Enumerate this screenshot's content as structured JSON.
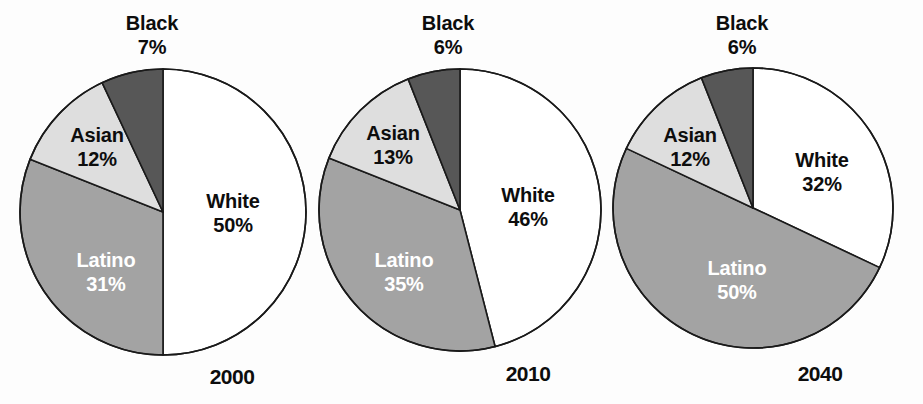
{
  "figure": {
    "width": 923,
    "height": 404,
    "background": "#fdfdfd"
  },
  "palette": {
    "White": "#ffffff",
    "Latino": "#a3a3a3",
    "Asian": "#dedede",
    "Black": "#575757",
    "outline": "#1a1a1a",
    "dark_text": "#0d0d0d",
    "light_text": "#ffffff"
  },
  "chart_data": [
    {
      "type": "pie",
      "title": "2000",
      "categories": [
        "White",
        "Latino",
        "Asian",
        "Black"
      ],
      "values": [
        50,
        31,
        12,
        7
      ],
      "labels": [
        "White\n50%",
        "Latino\n31%",
        "Asian\n12%",
        "Black\n7%"
      ],
      "colors": [
        "#ffffff",
        "#a3a3a3",
        "#dedede",
        "#575757"
      ],
      "start_angle_deg": 0,
      "direction": "clockwise",
      "center": [
        163,
        212
      ],
      "radius": 143,
      "legend": "none",
      "grid": false,
      "slices": [
        {
          "name": "White",
          "value": 50,
          "pct_label": "50%",
          "name_label": "White",
          "text_color": "#0d0d0d",
          "label_x": 233,
          "label_y": 213
        },
        {
          "name": "Latino",
          "value": 31,
          "pct_label": "31%",
          "name_label": "Latino",
          "text_color": "#ffffff",
          "label_x": 106,
          "label_y": 272
        },
        {
          "name": "Asian",
          "value": 12,
          "pct_label": "12%",
          "name_label": "Asian",
          "text_color": "#0d0d0d",
          "label_x": 97,
          "label_y": 147
        },
        {
          "name": "Black",
          "value": 7,
          "pct_label": "7%",
          "name_label": "Black",
          "text_color": "#0d0d0d",
          "label_x": 152,
          "label_y": 35
        }
      ],
      "year_label_x": 232,
      "year_label_y": 365
    },
    {
      "type": "pie",
      "title": "2010",
      "categories": [
        "White",
        "Latino",
        "Asian",
        "Black"
      ],
      "values": [
        46,
        35,
        13,
        6
      ],
      "labels": [
        "White\n46%",
        "Latino\n35%",
        "Asian\n13%",
        "Black\n6%"
      ],
      "colors": [
        "#ffffff",
        "#a3a3a3",
        "#dedede",
        "#575757"
      ],
      "start_angle_deg": 0,
      "direction": "clockwise",
      "center": [
        460,
        210
      ],
      "radius": 141,
      "legend": "none",
      "grid": false,
      "slices": [
        {
          "name": "White",
          "value": 46,
          "pct_label": "46%",
          "name_label": "White",
          "text_color": "#0d0d0d",
          "label_x": 528,
          "label_y": 207
        },
        {
          "name": "Latino",
          "value": 35,
          "pct_label": "35%",
          "name_label": "Latino",
          "text_color": "#ffffff",
          "label_x": 404,
          "label_y": 272
        },
        {
          "name": "Asian",
          "value": 13,
          "pct_label": "13%",
          "name_label": "Asian",
          "text_color": "#0d0d0d",
          "label_x": 393,
          "label_y": 145
        },
        {
          "name": "Black",
          "value": 6,
          "pct_label": "6%",
          "name_label": "Black",
          "text_color": "#0d0d0d",
          "label_x": 448,
          "label_y": 35
        }
      ],
      "year_label_x": 528,
      "year_label_y": 362
    },
    {
      "type": "pie",
      "title": "2040",
      "categories": [
        "White",
        "Latino",
        "Asian",
        "Black"
      ],
      "values": [
        32,
        50,
        12,
        6
      ],
      "labels": [
        "White\n32%",
        "Latino\n50%",
        "Asian\n12%",
        "Black\n6%"
      ],
      "colors": [
        "#ffffff",
        "#a3a3a3",
        "#dedede",
        "#575757"
      ],
      "start_angle_deg": 0,
      "direction": "clockwise",
      "center": [
        753,
        208
      ],
      "radius": 140,
      "legend": "none",
      "grid": false,
      "slices": [
        {
          "name": "White",
          "value": 32,
          "pct_label": "32%",
          "name_label": "White",
          "text_color": "#0d0d0d",
          "label_x": 822,
          "label_y": 172
        },
        {
          "name": "Latino",
          "value": 50,
          "pct_label": "50%",
          "name_label": "Latino",
          "text_color": "#ffffff",
          "label_x": 737,
          "label_y": 280
        },
        {
          "name": "Asian",
          "value": 12,
          "pct_label": "12%",
          "name_label": "Asian",
          "text_color": "#0d0d0d",
          "label_x": 690,
          "label_y": 147
        },
        {
          "name": "Black",
          "value": 6,
          "pct_label": "6%",
          "name_label": "Black",
          "text_color": "#0d0d0d",
          "label_x": 742,
          "label_y": 35
        }
      ],
      "year_label_x": 820,
      "year_label_y": 362
    }
  ]
}
